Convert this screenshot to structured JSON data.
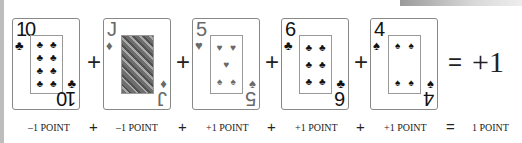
{
  "cards": [
    {
      "rank": "10",
      "suit": "♣",
      "color": "black",
      "pips": [
        "♣",
        "♣",
        "♣",
        "♣",
        "♣",
        "♣",
        "♣",
        "♣"
      ],
      "value_label": "–1 POINT"
    },
    {
      "rank": "J",
      "suit": "♦",
      "color": "red",
      "pips": [],
      "value_label": "–1 POINT"
    },
    {
      "rank": "5",
      "suit": "♥",
      "color": "red",
      "pips": [
        "♥",
        "♥",
        "♥",
        "♠",
        "♠"
      ],
      "value_label": "+1 POINT"
    },
    {
      "rank": "6",
      "suit": "♣",
      "color": "black",
      "pips": [
        "♣",
        "♣",
        "♣",
        "♣",
        "♣",
        "♣"
      ],
      "value_label": "+1 POINT"
    },
    {
      "rank": "4",
      "suit": "♠",
      "color": "black",
      "pips": [
        "♠",
        "♠",
        "♠",
        "♠"
      ],
      "value_label": "+1 POINT"
    }
  ],
  "operators": {
    "plus": "+",
    "equals": "="
  },
  "result": {
    "value": "+1",
    "label": "1 POINT"
  }
}
